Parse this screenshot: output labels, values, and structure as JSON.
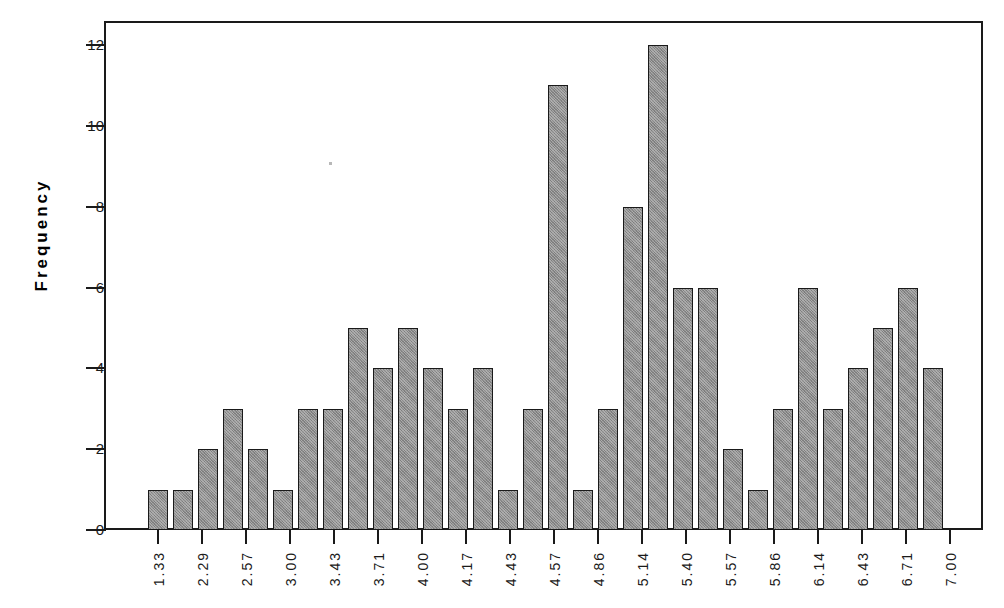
{
  "chart_data": {
    "type": "bar",
    "title": "",
    "subtitle": "",
    "xlabel": "",
    "ylabel": "Frequency",
    "ylim": [
      0,
      12
    ],
    "y_ticks": [
      0,
      2,
      4,
      6,
      8,
      10,
      12
    ],
    "grid": false,
    "legend": null,
    "x_tick_labels": [
      "1.33",
      "2.29",
      "2.57",
      "3.00",
      "3.43",
      "3.71",
      "4.00",
      "4.17",
      "4.43",
      "4.57",
      "4.86",
      "5.14",
      "5.40",
      "5.57",
      "5.86",
      "6.14",
      "6.43",
      "6.71",
      "7.00"
    ],
    "categories": [
      "1",
      "2",
      "3",
      "4",
      "5",
      "6",
      "7",
      "8",
      "9",
      "10",
      "11",
      "12",
      "13",
      "14",
      "15",
      "16",
      "17",
      "18",
      "19",
      "20",
      "21",
      "22",
      "23",
      "24",
      "25",
      "26",
      "27",
      "28",
      "29",
      "30",
      "31",
      "32"
    ],
    "values": [
      1,
      1,
      2,
      3,
      2,
      1,
      3,
      3,
      5,
      4,
      5,
      4,
      3,
      4,
      1,
      3,
      11,
      1,
      3,
      8,
      12,
      6,
      6,
      2,
      1,
      3,
      6,
      3,
      4,
      5,
      6,
      4
    ],
    "bar_color": "#8c8c8c",
    "bar_edge_color": "#1a1a1a",
    "axis_color": "#1a1a1a",
    "background_color": "#ffffff"
  },
  "axes": {
    "y_title": "Frequency",
    "y_ticks": [
      {
        "value": 12,
        "label": "12"
      },
      {
        "value": 10,
        "label": "10"
      },
      {
        "value": 8,
        "label": "8"
      },
      {
        "value": 6,
        "label": "6"
      },
      {
        "value": 4,
        "label": "4"
      },
      {
        "value": 2,
        "label": "2"
      },
      {
        "value": 0,
        "label": "0"
      }
    ],
    "x_ticks": [
      {
        "label": "1.33"
      },
      {
        "label": "2.29"
      },
      {
        "label": "2.57"
      },
      {
        "label": "3.00"
      },
      {
        "label": "3.43"
      },
      {
        "label": "3.71"
      },
      {
        "label": "4.00"
      },
      {
        "label": "4.17"
      },
      {
        "label": "4.43"
      },
      {
        "label": "4.57"
      },
      {
        "label": "4.86"
      },
      {
        "label": "5.14"
      },
      {
        "label": "5.40"
      },
      {
        "label": "5.57"
      },
      {
        "label": "5.86"
      },
      {
        "label": "6.14"
      },
      {
        "label": "6.43"
      },
      {
        "label": "6.71"
      },
      {
        "label": "7.00"
      }
    ]
  }
}
